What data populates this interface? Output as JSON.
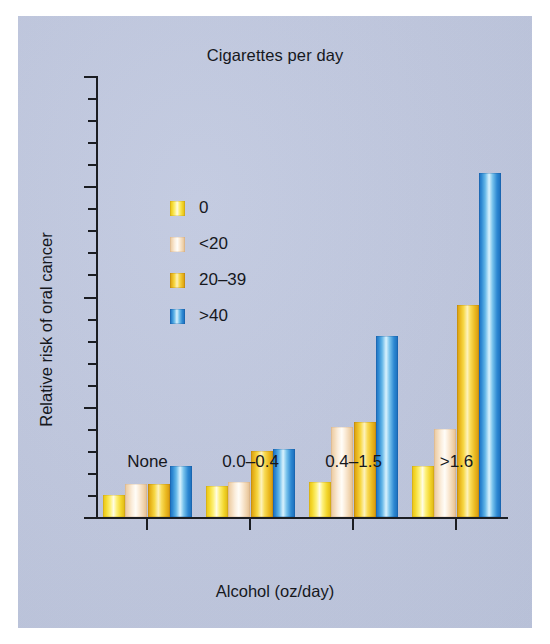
{
  "chart_data": {
    "type": "bar",
    "title": "Cigarettes per day",
    "xlabel": "Alcohol (oz/day)",
    "ylabel": "Relative risk of oral cancer",
    "categories": [
      "None",
      "0.0–0.4",
      "0.4–1.5",
      ">1.6"
    ],
    "series": [
      {
        "name": "0",
        "color": "#f4d82a",
        "values": [
          1.0,
          1.4,
          1.6,
          2.3
        ]
      },
      {
        "name": "<20",
        "color": "#f6e3cc",
        "values": [
          1.5,
          1.6,
          4.1,
          4.0
        ]
      },
      {
        "name": "20–39",
        "color": "#ebb91f",
        "values": [
          1.5,
          3.0,
          4.3,
          9.6
        ]
      },
      {
        "name": ">40",
        "color": "#2f8ad3",
        "values": [
          2.3,
          3.1,
          8.2,
          15.6
        ]
      }
    ],
    "ylim": [
      0,
      20
    ],
    "y_major_ticks": [
      0,
      5,
      10,
      15,
      20
    ],
    "y_tick_labels": [
      "0",
      "5",
      "10",
      "15",
      "20"
    ],
    "y_minor_tick_interval": 1,
    "grid": false,
    "legend_position": "upper-left-inside",
    "legend_title": "Cigarettes per day",
    "background_color": "#bfc7de"
  },
  "legend": {
    "items": [
      {
        "label": "0"
      },
      {
        "label": "<20"
      },
      {
        "label": "20–39"
      },
      {
        "label": ">40"
      }
    ]
  }
}
